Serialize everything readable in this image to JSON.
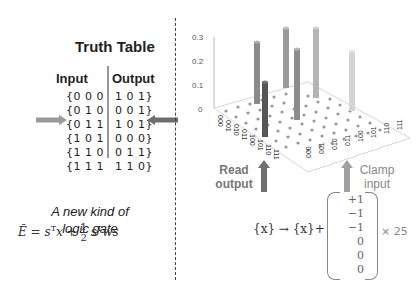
{
  "left_panel": {
    "title": "Truth Table",
    "headers": {
      "input": "Input",
      "output": "Output"
    },
    "rows": [
      {
        "input": "{0 0 0",
        "output": "1 0 1}"
      },
      {
        "input": "{0 1 0",
        "output": "0 0 1}"
      },
      {
        "input": "{0 1 1",
        "output": "1 0 1}"
      },
      {
        "input": "{1 0 1",
        "output": "0 0 0}"
      },
      {
        "input": "{1 1 0",
        "output": "0 1 1}"
      },
      {
        "input": "{1 1 1",
        "output": "1 1 0}"
      }
    ],
    "highlighted_row_index": 2,
    "caption_line1": "A new kind of",
    "caption_line2": "logic gate",
    "energy_equation": "Ẽ = sᵀx + ½ sᵀws"
  },
  "right_panel": {
    "z_ticks": [
      "0.3",
      "0.2",
      "0.1",
      "0"
    ],
    "x_axis_labels": [
      "000",
      "001",
      "010",
      "011",
      "100",
      "101",
      "110",
      "111"
    ],
    "y_axis_labels": [
      "000",
      "001",
      "010",
      "011",
      "100",
      "101",
      "110",
      "111"
    ],
    "read_label_line1": "Read",
    "read_label_line2": "output",
    "clamp_label_line1": "Clamp",
    "clamp_label_line2": "input",
    "map_equation": "{x} → {x}+",
    "vector": [
      "+1",
      "−1",
      "−1",
      "0",
      "0",
      "0"
    ],
    "multiplier": "× 25"
  },
  "colors": {
    "arrow_gray": "#999999",
    "arrow_dark": "#707070",
    "bar_dark": "#555555",
    "bar_mid": "#9a9a9a",
    "bar_light": "#cfcfcf"
  }
}
